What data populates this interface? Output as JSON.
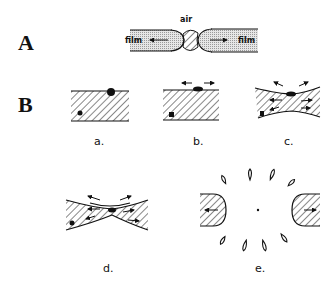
{
  "figure": {
    "panels": [
      {
        "id": "A",
        "label": "A",
        "annotations": {
          "top": "air",
          "left": "film",
          "right": "film"
        },
        "description": "Film rupture with air hole in center; film retracts outward (arrows)"
      },
      {
        "id": "B",
        "label": "B",
        "subfigures": [
          {
            "id": "a",
            "label": "a.",
            "description": "Flat film with particle at surface and particle inside"
          },
          {
            "id": "b",
            "label": "b.",
            "description": "Particle spreads at surface, outward arrows"
          },
          {
            "id": "c",
            "label": "c.",
            "description": "Film thins locally, flow arrows inside"
          },
          {
            "id": "d",
            "label": "d.",
            "description": "Film strongly necked, flow toward edges"
          },
          {
            "id": "e",
            "label": "e.",
            "description": "Film ruptured; rims retract, droplets form ring"
          }
        ]
      }
    ],
    "colors": {
      "ink": "#111111",
      "film_fill": "#d9d9d9",
      "background": "#ffffff"
    }
  }
}
